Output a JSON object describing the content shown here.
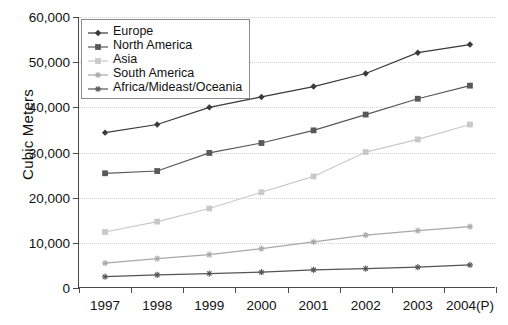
{
  "chart_data": {
    "type": "line",
    "title": "",
    "xlabel": "",
    "ylabel": "Cubic Meters",
    "categories": [
      "1997",
      "1998",
      "1999",
      "2000",
      "2001",
      "2002",
      "2003",
      "2004(P)"
    ],
    "ylim": [
      0,
      60000
    ],
    "ytick_values": [
      0,
      10000,
      20000,
      30000,
      40000,
      50000,
      60000
    ],
    "ytick_labels": [
      "0",
      "10,000",
      "20,000",
      "30,000",
      "40,000",
      "50,000",
      "60,000"
    ],
    "grid": true,
    "grid_axis": "y",
    "legend_position": "top-left",
    "series": [
      {
        "name": "Europe",
        "color": "#3a3a3a",
        "marker": "diamond",
        "values": [
          34400,
          36200,
          40000,
          42300,
          44600,
          47500,
          52100,
          53900
        ]
      },
      {
        "name": "North America",
        "color": "#595959",
        "marker": "square",
        "values": [
          25400,
          25900,
          29900,
          32100,
          34900,
          38400,
          41900,
          44800
        ]
      },
      {
        "name": "Asia",
        "color": "#c9c9c9",
        "marker": "square",
        "values": [
          12400,
          14700,
          17600,
          21200,
          24700,
          30100,
          32900,
          36200
        ]
      },
      {
        "name": "South America",
        "color": "#a8a8a8",
        "marker": "star",
        "values": [
          5500,
          6500,
          7400,
          8700,
          10200,
          11700,
          12700,
          13600
        ]
      },
      {
        "name": "Africa/Mideast/Oceania",
        "color": "#555555",
        "marker": "star",
        "values": [
          2500,
          2900,
          3200,
          3500,
          4000,
          4300,
          4600,
          5100
        ]
      }
    ]
  },
  "legend": {
    "items": [
      {
        "label": "Europe"
      },
      {
        "label": "North America"
      },
      {
        "label": "Asia"
      },
      {
        "label": "South America"
      },
      {
        "label": "Africa/Mideast/Oceania"
      }
    ]
  }
}
